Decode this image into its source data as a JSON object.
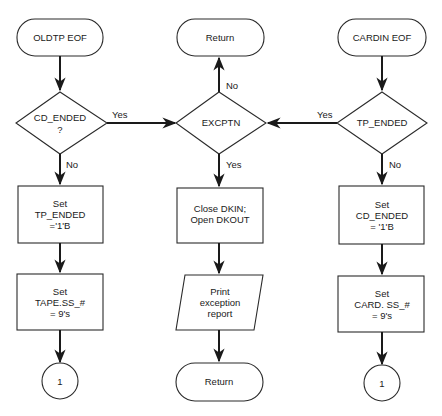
{
  "diagram": {
    "type": "flowchart",
    "left": {
      "start": "OLDTP EOF",
      "decision": [
        "CD_ENDED",
        "?"
      ],
      "decision_yes": "Yes",
      "decision_no": "No",
      "process1": [
        "Set",
        "TP_ENDED",
        "='1'B"
      ],
      "process2": [
        "Set",
        "TAPE.SS_#",
        "= 9's"
      ],
      "connector": "1"
    },
    "center": {
      "return_top": "Return",
      "decision": "EXCPTN",
      "decision_no": "No",
      "decision_yes": "Yes",
      "process": [
        "Close DKIN;",
        "Open DKOUT"
      ],
      "io": [
        "Print",
        "exception",
        "report"
      ],
      "return_bottom": "Return"
    },
    "right": {
      "start": "CARDIN EOF",
      "decision": "TP_ENDED",
      "decision_yes": "Yes",
      "decision_no": "No",
      "process1": [
        "Set",
        "CD_ENDED",
        "= '1'B"
      ],
      "process2": [
        "Set",
        "CARD. SS_#",
        "= 9's"
      ],
      "connector": "1"
    }
  }
}
